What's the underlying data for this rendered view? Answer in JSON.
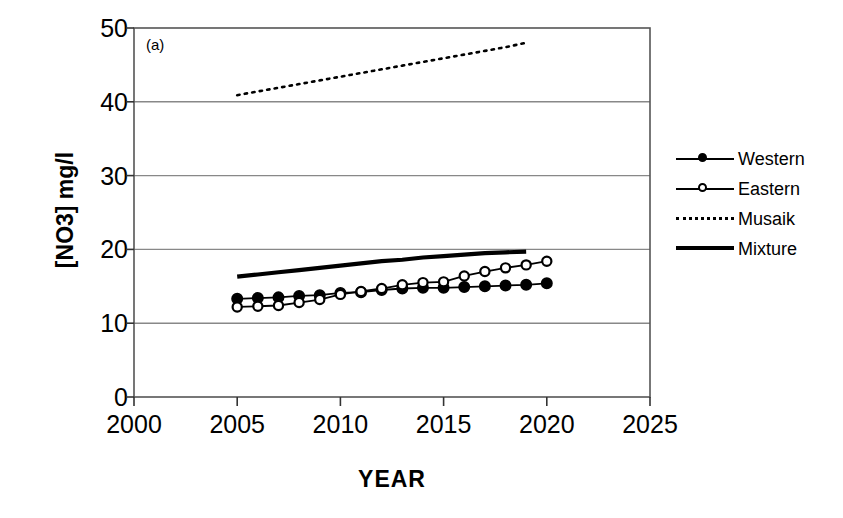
{
  "chart_data": {
    "type": "line",
    "title": "",
    "panel_label": "(a)",
    "xlabel": "YEAR",
    "ylabel": "[NO3] mg/l",
    "xlim": [
      2000,
      2025
    ],
    "ylim": [
      0,
      50
    ],
    "xticks": [
      2000,
      2005,
      2010,
      2015,
      2020,
      2025
    ],
    "yticks": [
      0,
      10,
      20,
      30,
      40,
      50
    ],
    "grid": "horizontal",
    "legend_position": "right",
    "series": [
      {
        "name": "Western",
        "style": "solid-filled-circles",
        "color": "#000000",
        "x": [
          2005,
          2006,
          2007,
          2008,
          2009,
          2010,
          2011,
          2012,
          2013,
          2014,
          2015,
          2016,
          2017,
          2018,
          2019,
          2020
        ],
        "values": [
          13.3,
          13.4,
          13.5,
          13.7,
          13.8,
          14.1,
          14.2,
          14.5,
          14.7,
          14.8,
          14.8,
          14.9,
          15.0,
          15.1,
          15.2,
          15.4
        ]
      },
      {
        "name": "Eastern",
        "style": "solid-open-circles",
        "color": "#000000",
        "x": [
          2005,
          2006,
          2007,
          2008,
          2009,
          2010,
          2011,
          2012,
          2013,
          2014,
          2015,
          2016,
          2017,
          2018,
          2019,
          2020
        ],
        "values": [
          12.2,
          12.3,
          12.4,
          12.8,
          13.2,
          13.9,
          14.3,
          14.7,
          15.2,
          15.5,
          15.6,
          16.4,
          17.0,
          17.5,
          17.9,
          18.4
        ]
      },
      {
        "name": "Musaik",
        "style": "dotted",
        "color": "#000000",
        "x": [
          2005,
          2006,
          2007,
          2008,
          2009,
          2010,
          2011,
          2012,
          2013,
          2014,
          2015,
          2016,
          2017,
          2018,
          2019
        ],
        "values": [
          40.9,
          41.4,
          41.9,
          42.4,
          42.9,
          43.4,
          43.9,
          44.4,
          44.9,
          45.4,
          45.9,
          46.4,
          46.9,
          47.4,
          48.0
        ]
      },
      {
        "name": "Mixture",
        "style": "thick-solid",
        "color": "#000000",
        "x": [
          2005,
          2006,
          2007,
          2008,
          2009,
          2010,
          2011,
          2012,
          2013,
          2014,
          2015,
          2016,
          2017,
          2018,
          2019
        ],
        "values": [
          16.3,
          16.6,
          16.9,
          17.2,
          17.5,
          17.8,
          18.1,
          18.4,
          18.6,
          18.9,
          19.1,
          19.3,
          19.5,
          19.6,
          19.7
        ]
      }
    ]
  },
  "axes": {
    "ytick_labels": [
      "50",
      "40",
      "30",
      "20",
      "10",
      "0"
    ],
    "xtick_labels": [
      "2000",
      "2005",
      "2010",
      "2015",
      "2020",
      "2025"
    ],
    "ylabel": "[NO3] mg/l",
    "xlabel": "YEAR",
    "panel_label": "(a)"
  },
  "legend": {
    "items": [
      {
        "label": "Western",
        "style": "solid-filled-circles"
      },
      {
        "label": "Eastern",
        "style": "solid-open-circles"
      },
      {
        "label": "Musaik",
        "style": "dotted"
      },
      {
        "label": "Mixture",
        "style": "thick-solid"
      }
    ]
  },
  "colors": {
    "ink": "#000000",
    "grid": "#808080",
    "background": "#ffffff"
  }
}
